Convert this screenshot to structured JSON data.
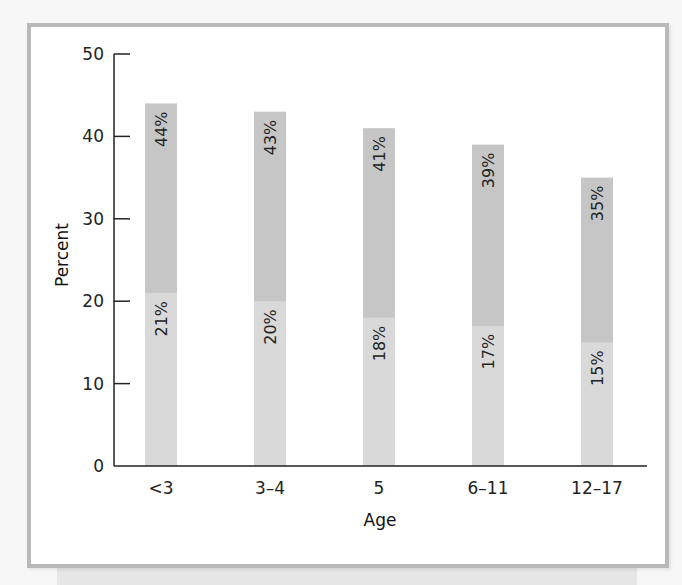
{
  "chart_data": {
    "type": "bar",
    "stacked_overlay": true,
    "title": "",
    "xlabel": "Age",
    "ylabel": "Percent",
    "ylim": [
      0,
      50
    ],
    "yticks": [
      0,
      10,
      20,
      30,
      40,
      50
    ],
    "categories": [
      "<3",
      "3–4",
      "5",
      "6–11",
      "12–17"
    ],
    "series": [
      {
        "name": "Total (upper segment)",
        "values": [
          44,
          43,
          41,
          39,
          35
        ],
        "labels": [
          "44%",
          "43%",
          "41%",
          "39%",
          "35%"
        ],
        "color": "#c6c6c6"
      },
      {
        "name": "Subset (lower segment)",
        "values": [
          21,
          20,
          18,
          17,
          15
        ],
        "labels": [
          "21%",
          "20%",
          "18%",
          "17%",
          "15%"
        ],
        "color": "#d9d9d9"
      }
    ],
    "grid": false,
    "legend": "none"
  },
  "colors": {
    "frame": "#b9b9b9",
    "upper": "#c6c6c6",
    "lower": "#d9d9d9",
    "axis": "#222222"
  }
}
